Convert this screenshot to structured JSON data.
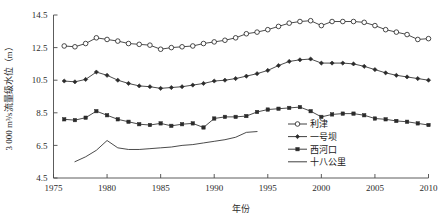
{
  "chart_data": {
    "type": "line",
    "title": "",
    "xlabel": "年份",
    "ylabel": "3 000 m³/s流量级水位（m）",
    "xlim": [
      1975,
      2010
    ],
    "ylim": [
      4.5,
      14.5
    ],
    "xticks": [
      1975,
      1980,
      1985,
      1990,
      1995,
      2000,
      2005,
      2010
    ],
    "yticks": [
      4.5,
      6.5,
      8.5,
      10.5,
      12.5,
      14.5
    ],
    "grid": false,
    "legend_position": "bottom-right",
    "series": [
      {
        "name": "利津",
        "marker": "open-circle",
        "color": "#2b2b2b",
        "x": [
          1976,
          1977,
          1978,
          1979,
          1980,
          1981,
          1982,
          1983,
          1984,
          1985,
          1986,
          1987,
          1988,
          1989,
          1990,
          1991,
          1992,
          1993,
          1994,
          1995,
          1996,
          1997,
          1998,
          1999,
          2000,
          2001,
          2002,
          2003,
          2004,
          2005,
          2006,
          2007,
          2008,
          2009,
          2010
        ],
        "y": [
          12.6,
          12.55,
          12.75,
          13.1,
          13.0,
          12.9,
          12.75,
          12.7,
          12.65,
          12.4,
          12.5,
          12.55,
          12.6,
          12.75,
          12.85,
          12.95,
          13.1,
          13.35,
          13.45,
          13.6,
          13.8,
          14.0,
          14.1,
          14.15,
          13.85,
          14.1,
          14.1,
          14.1,
          14.05,
          13.85,
          13.6,
          13.45,
          13.3,
          13.0,
          13.05
        ]
      },
      {
        "name": "一号坝",
        "marker": "filled-diamond",
        "color": "#2b2b2b",
        "x": [
          1976,
          1977,
          1978,
          1979,
          1980,
          1981,
          1982,
          1983,
          1984,
          1985,
          1986,
          1987,
          1988,
          1989,
          1990,
          1991,
          1992,
          1993,
          1994,
          1995,
          1996,
          1997,
          1998,
          1999,
          2000,
          2001,
          2002,
          2003,
          2004,
          2005,
          2006,
          2007,
          2008,
          2009,
          2010
        ],
        "y": [
          10.45,
          10.4,
          10.55,
          11.0,
          10.8,
          10.5,
          10.3,
          10.15,
          10.1,
          10.0,
          10.05,
          10.1,
          10.2,
          10.3,
          10.45,
          10.5,
          10.6,
          10.75,
          10.9,
          11.1,
          11.4,
          11.65,
          11.75,
          11.8,
          11.55,
          11.55,
          11.55,
          11.5,
          11.35,
          11.15,
          10.95,
          10.8,
          10.7,
          10.6,
          10.5
        ]
      },
      {
        "name": "西河口",
        "marker": "filled-square",
        "color": "#2b2b2b",
        "x": [
          1976,
          1977,
          1978,
          1979,
          1980,
          1981,
          1982,
          1983,
          1984,
          1985,
          1986,
          1987,
          1988,
          1989,
          1990,
          1991,
          1992,
          1993,
          1994,
          1995,
          1996,
          1997,
          1998,
          1999,
          2000,
          2001,
          2002,
          2003,
          2004,
          2005,
          2006,
          2007,
          2008,
          2009,
          2010
        ],
        "y": [
          8.1,
          8.05,
          8.2,
          8.6,
          8.35,
          8.1,
          7.95,
          7.8,
          7.75,
          7.85,
          7.7,
          7.8,
          7.85,
          7.6,
          8.15,
          8.25,
          8.25,
          8.3,
          8.55,
          8.7,
          8.75,
          8.8,
          8.85,
          8.6,
          8.25,
          8.4,
          8.45,
          8.45,
          8.35,
          8.15,
          8.1,
          8.0,
          7.95,
          7.85,
          7.75
        ]
      },
      {
        "name": "十八公里",
        "marker": "none",
        "color": "#2b2b2b",
        "x": [
          1977,
          1978,
          1979,
          1980,
          1981,
          1982,
          1983,
          1984,
          1985,
          1986,
          1987,
          1988,
          1989,
          1990,
          1991,
          1992,
          1993,
          1994
        ],
        "y": [
          5.5,
          5.8,
          6.2,
          6.8,
          6.35,
          6.25,
          6.25,
          6.3,
          6.35,
          6.4,
          6.5,
          6.55,
          6.65,
          6.75,
          6.85,
          7.0,
          7.3,
          7.35
        ]
      }
    ]
  },
  "legend": {
    "items": [
      {
        "label": "利津",
        "marker": "open-circle"
      },
      {
        "label": "一号坝",
        "marker": "filled-diamond"
      },
      {
        "label": "西河口",
        "marker": "filled-square"
      },
      {
        "label": "十八公里",
        "marker": "none"
      }
    ]
  }
}
